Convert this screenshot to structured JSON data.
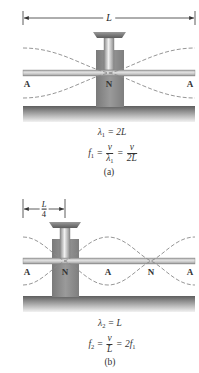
{
  "colors": {
    "rod_light": "#d8d8d8",
    "rod_dark": "#8a8a8a",
    "block": "#8e8e8e",
    "block_dark": "#6e6e6e",
    "base_top": "#6a6a6a",
    "base_bottom": "#e6e6e6",
    "wave": "#888888",
    "dim_line": "#333333"
  },
  "panel_a": {
    "dimension_label": "L",
    "node_labels": [
      {
        "text": "A",
        "x": 27
      },
      {
        "text": "N",
        "x": 108
      },
      {
        "text": "A",
        "x": 190
      }
    ],
    "eq1": {
      "lhs": "λ",
      "sub": "1",
      "rhs": " = 2L"
    },
    "eq2": {
      "lhs": "f",
      "lhs_sub": "1",
      "eq": " = ",
      "frac1_num": "v",
      "frac1_den": "λ",
      "frac1_den_sub": "1",
      "eq2": " = ",
      "frac2_num": "v",
      "frac2_den": "2L"
    },
    "caption": "(a)"
  },
  "panel_b": {
    "dimension_num": "L",
    "dimension_den": "4",
    "node_labels": [
      {
        "text": "A",
        "x": 27
      },
      {
        "text": "N",
        "x": 65
      },
      {
        "text": "A",
        "x": 108
      },
      {
        "text": "N",
        "x": 151
      },
      {
        "text": "A",
        "x": 190
      }
    ],
    "eq1": {
      "lhs": "λ",
      "sub": "2",
      "rhs": " = L"
    },
    "eq2": {
      "lhs": "f",
      "lhs_sub": "2",
      "eq": " = ",
      "frac_num": "v",
      "frac_den": "L",
      "rhs": " = 2f",
      "rhs_sub": "1"
    },
    "caption": "(b)"
  }
}
